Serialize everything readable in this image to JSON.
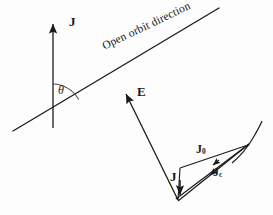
{
  "figure": {
    "background_color": "#fdfdfd",
    "ink_color": "#1b1b1b",
    "width": 273,
    "height": 215,
    "labels": {
      "orbit_direction": "Open orbit direction",
      "current_axis": "J",
      "angle": "θ",
      "electric_field": "E",
      "current_vector": "J",
      "current_open_orbit": "J",
      "current_open_orbit_sub": "0",
      "current_closed_orbit": "J",
      "current_closed_orbit_sub": "c"
    },
    "geometry": {
      "open_orbit_line": {
        "x1": 13,
        "y1": 131,
        "x2": 219,
        "y2": 8
      },
      "j_axis": {
        "x1": 53,
        "y1": 128,
        "x2": 53,
        "y2": 21
      },
      "angle_arc": {
        "cx": 53,
        "cy": 114,
        "radius": 30,
        "start_deg": -90,
        "end_deg": -31
      },
      "e_vector": {
        "x1": 178,
        "y1": 200,
        "x2": 125,
        "y2": 92
      },
      "apex": {
        "x": 249,
        "y": 144
      },
      "vertex": {
        "x": 178,
        "y": 201
      },
      "j_short_arrow": {
        "x1": 180,
        "y1": 181,
        "x2": 180,
        "y2": 196
      }
    }
  }
}
